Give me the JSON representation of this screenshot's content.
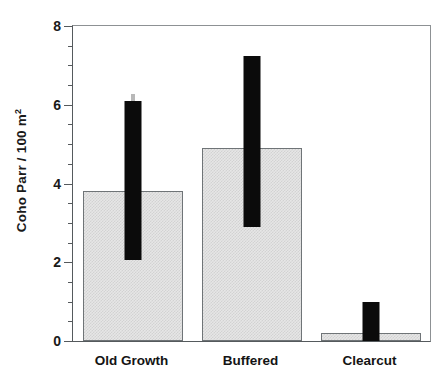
{
  "chart_data": {
    "type": "bar",
    "title": "",
    "xlabel": "",
    "ylabel": "Coho Parr / 100 m",
    "ylabel_superscript": "2",
    "ylabel_full": "Coho Parr / 100 m2",
    "categories": [
      "Old Growth",
      "Buffered",
      "Clearcut"
    ],
    "values": [
      3.8,
      4.9,
      0.2
    ],
    "error_high": [
      6.1,
      7.25,
      1.0
    ],
    "error_low": [
      2.05,
      2.9,
      0.0
    ],
    "ylim": [
      0,
      8
    ],
    "ytick_labels": [
      "0",
      "2",
      "4",
      "6",
      "8"
    ],
    "ytick_values": [
      0,
      2,
      4,
      6,
      8
    ],
    "yminor_step": 0.5,
    "grid": false,
    "legend": null,
    "series": [
      {
        "name": "Coho Parr density",
        "values": [
          3.8,
          4.9,
          0.2
        ]
      }
    ],
    "bar_fill_color": "#e6e6e6",
    "bar_edge_color": "#6f7477",
    "error_bar_color": "#0b0b0b",
    "axis_color": "#55595c"
  }
}
